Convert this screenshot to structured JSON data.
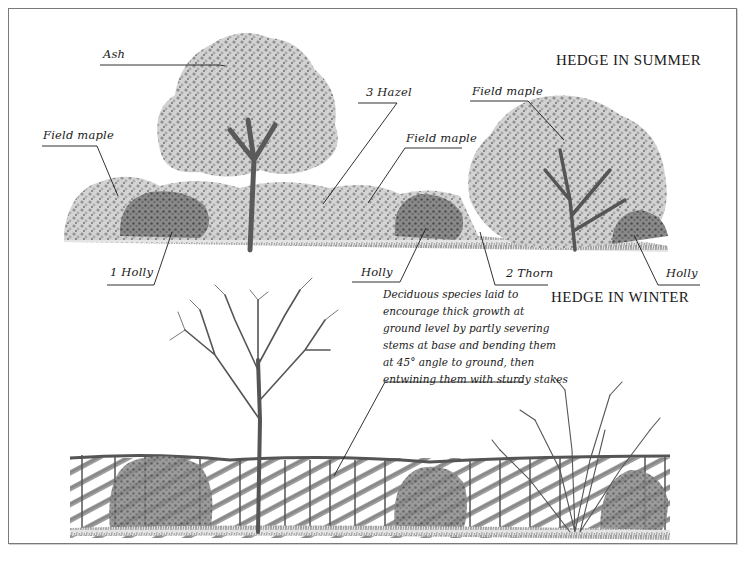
{
  "summer": {
    "heading": "HEDGE IN SUMMER",
    "labels": {
      "ash": "Ash",
      "field_maple_left": "Field maple",
      "hazel": "3 Hazel",
      "field_maple_top_right": "Field maple",
      "field_maple_mid": "Field maple",
      "holly_left": "1 Holly",
      "holly_mid": "Holly",
      "thorn": "2 Thorn",
      "holly_right": "Holly"
    }
  },
  "winter": {
    "heading": "HEDGE IN WINTER",
    "note_lines": [
      "Deciduous species laid to",
      "encourage thick growth at",
      "ground level by partly severing",
      "stems at base and bending them",
      "at 45° angle to ground, then",
      "entwining them with sturdy stakes"
    ]
  },
  "colors": {
    "ink": "#1a1a1a",
    "foliage_light": "#c8c8c8",
    "foliage_mid": "#9a9a9a",
    "foliage_dark": "#5e5e5e",
    "frame": "#7a7a7a"
  }
}
